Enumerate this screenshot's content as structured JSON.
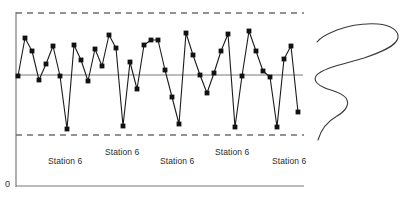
{
  "figure": {
    "name": "control-chart-with-density",
    "origin_label": "0"
  },
  "axes": {
    "y_axis_x": 16,
    "y_axis_top": 12,
    "y_axis_bottom": 187,
    "x_axis_y": 186,
    "x_axis_left": 16,
    "x_axis_right": 304
  },
  "reference_lines": {
    "upper_control_limit_y": 13,
    "lower_control_limit_y": 135,
    "center_line_y": 75,
    "dashed_left": 16,
    "dashed_right": 304,
    "center_left": 16,
    "center_right": 303
  },
  "station_labels": [
    {
      "text": "Station 6",
      "x": 48,
      "y": 156
    },
    {
      "text": "Station 6",
      "x": 105,
      "y": 147
    },
    {
      "text": "Station 6",
      "x": 160,
      "y": 156
    },
    {
      "text": "Station 6",
      "x": 215,
      "y": 147
    },
    {
      "text": "Station 6",
      "x": 272,
      "y": 156
    }
  ],
  "chart_data": {
    "type": "line",
    "title": "",
    "xlabel": "",
    "ylabel": "",
    "grid": false,
    "legend": "none",
    "ylim": [
      135,
      13
    ],
    "annotations": [
      "Station 6",
      "Station 6",
      "Station 6",
      "Station 6",
      "Station 6",
      "0"
    ],
    "reference_values": {
      "upper_control_limit": 13,
      "center_line": 75,
      "lower_control_limit": 135
    },
    "marker": "square",
    "x": [
      18,
      25,
      32,
      39,
      46,
      53,
      60,
      67,
      74,
      81,
      88,
      95,
      102,
      109,
      116,
      123,
      130,
      137,
      144,
      151,
      158,
      165,
      172,
      179,
      186,
      193,
      200,
      207,
      214,
      221,
      228,
      235,
      242,
      249,
      256,
      263,
      270,
      277,
      284,
      291,
      298
    ],
    "values": [
      76,
      38,
      51,
      80,
      64,
      46,
      76,
      129,
      45,
      60,
      81,
      49,
      66,
      35,
      48,
      126,
      62,
      89,
      45,
      40,
      40,
      70,
      97,
      124,
      33,
      55,
      75,
      93,
      73,
      51,
      34,
      127,
      76,
      31,
      51,
      71,
      77,
      127,
      59,
      46,
      112
    ],
    "series": [
      {
        "name": "measurement",
        "points": [
          [
            18,
            76
          ],
          [
            25,
            38
          ],
          [
            32,
            51
          ],
          [
            39,
            80
          ],
          [
            46,
            64
          ],
          [
            53,
            46
          ],
          [
            60,
            76
          ],
          [
            67,
            129
          ],
          [
            74,
            45
          ],
          [
            81,
            60
          ],
          [
            88,
            81
          ],
          [
            95,
            49
          ],
          [
            102,
            66
          ],
          [
            109,
            35
          ],
          [
            116,
            48
          ],
          [
            123,
            126
          ],
          [
            130,
            62
          ],
          [
            137,
            89
          ],
          [
            144,
            45
          ],
          [
            151,
            40
          ],
          [
            158,
            40
          ],
          [
            165,
            70
          ],
          [
            172,
            97
          ],
          [
            179,
            124
          ],
          [
            186,
            33
          ],
          [
            193,
            55
          ],
          [
            200,
            75
          ],
          [
            207,
            93
          ],
          [
            214,
            73
          ],
          [
            221,
            51
          ],
          [
            228,
            34
          ],
          [
            235,
            127
          ],
          [
            242,
            76
          ],
          [
            249,
            31
          ],
          [
            256,
            51
          ],
          [
            263,
            71
          ],
          [
            270,
            77
          ],
          [
            277,
            127
          ],
          [
            284,
            59
          ],
          [
            291,
            46
          ],
          [
            298,
            112
          ]
        ]
      }
    ],
    "density_curve": {
      "name": "bimodal-distribution",
      "orientation": "vertical",
      "description": "sideways bimodal probability density curve",
      "path": "M 318 140 C 322 126, 330 120, 337 116 C 346 111, 350 104, 346 98 C 341 92, 332 91, 325 88 C 318 85, 313 81, 316 76 C 322 68, 344 64, 364 58 C 382 52, 396 46, 398 38 C 399 30, 390 25, 378 24 C 364 23, 348 26, 337 30 C 327 34, 320 38, 317 42"
    }
  }
}
